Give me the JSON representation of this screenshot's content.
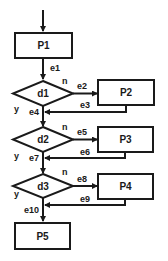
{
  "diagram": {
    "type": "flowchart",
    "colors": {
      "stroke": "#1a1a1a",
      "fill": "#ffffff",
      "background": "#ffffff"
    },
    "nodes": {
      "P1": {
        "label": "P1",
        "kind": "process"
      },
      "d1": {
        "label": "d1",
        "kind": "decision"
      },
      "P2": {
        "label": "P2",
        "kind": "process"
      },
      "d2": {
        "label": "d2",
        "kind": "decision"
      },
      "P3": {
        "label": "P3",
        "kind": "process"
      },
      "d3": {
        "label": "d3",
        "kind": "decision"
      },
      "P4": {
        "label": "P4",
        "kind": "process"
      },
      "P5": {
        "label": "P5",
        "kind": "process"
      }
    },
    "edges": {
      "e1": {
        "label": "e1",
        "from": "P1",
        "to": "d1"
      },
      "e2": {
        "label": "e2",
        "from": "d1",
        "to": "P2"
      },
      "e3": {
        "label": "e3",
        "from": "P2",
        "to": "d1-merge"
      },
      "e4": {
        "label": "e4",
        "from": "d1",
        "to": "d2"
      },
      "e5": {
        "label": "e5",
        "from": "d2",
        "to": "P3"
      },
      "e6": {
        "label": "e6",
        "from": "P3",
        "to": "d2-merge"
      },
      "e7": {
        "label": "e7",
        "from": "d2",
        "to": "d3"
      },
      "e8": {
        "label": "e8",
        "from": "d3",
        "to": "P4"
      },
      "e9": {
        "label": "e9",
        "from": "P4",
        "to": "d3-merge"
      },
      "e10": {
        "label": "e10",
        "from": "d3",
        "to": "P5"
      }
    },
    "branch_labels": {
      "d1_no": "n",
      "d1_yes": "y",
      "d2_no": "n",
      "d2_yes": "y",
      "d3_no": "n",
      "d3_yes": "y"
    }
  }
}
